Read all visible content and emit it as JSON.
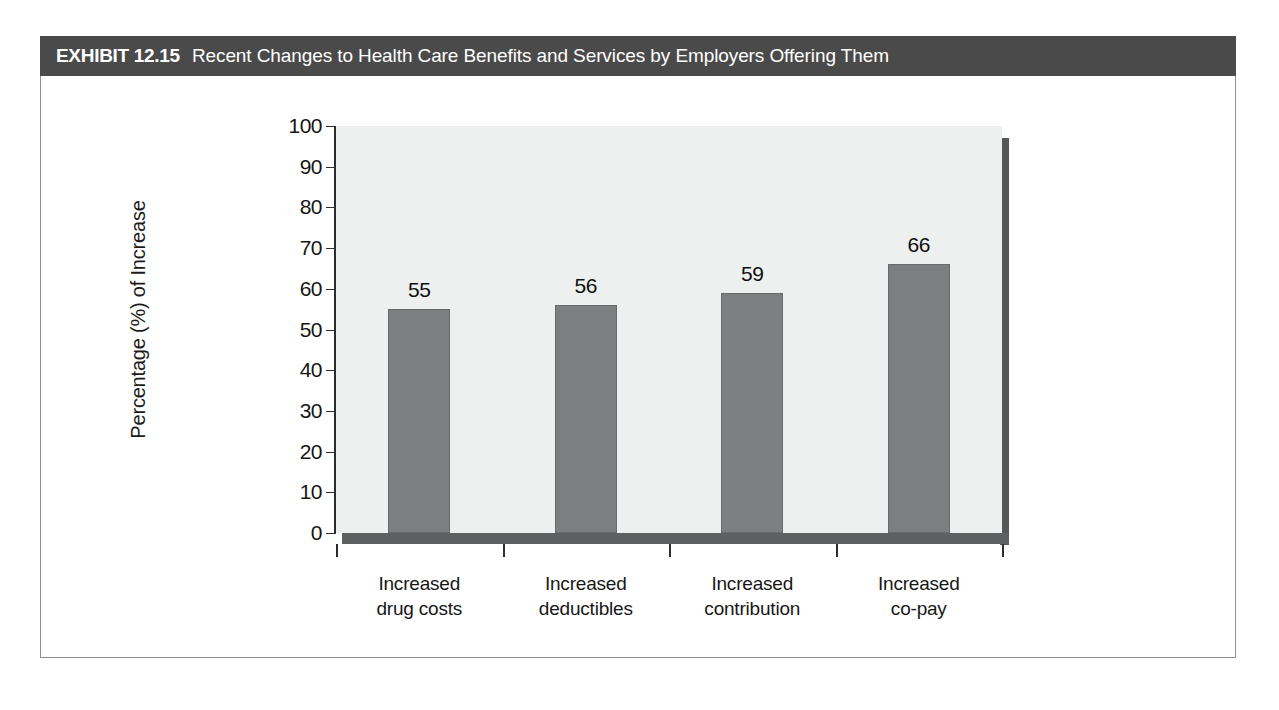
{
  "exhibit": {
    "number": "EXHIBIT 12.15",
    "title": "Recent Changes to Health Care Benefits and Services by Employers Offering Them"
  },
  "colors": {
    "title_bar_bg": "#4a4a4a",
    "title_text": "#ffffff",
    "bar_fill": "#7c7e80",
    "plot_bg": "#eef0f0",
    "axis": "#2d2d2d",
    "frame_border": "#8d8f92"
  },
  "chart_data": {
    "type": "bar",
    "title": "Recent Changes to Health Care Benefits and Services by Employers Offering Them",
    "categories": [
      "Increased drug costs",
      "Increased deductibles",
      "Increased contribution",
      "Increased co-pay"
    ],
    "category_lines": [
      [
        "Increased",
        "drug costs"
      ],
      [
        "Increased",
        "deductibles"
      ],
      [
        "Increased",
        "contribution"
      ],
      [
        "Increased",
        "co-pay"
      ]
    ],
    "values": [
      55,
      56,
      59,
      66
    ],
    "data_labels": [
      "55",
      "56",
      "59",
      "66"
    ],
    "xlabel": "",
    "ylabel": "Percentage (%) of Increase",
    "ylim": [
      0,
      100
    ],
    "ytick_step": 10,
    "ytick_labels": [
      "100",
      "90",
      "80",
      "70",
      "60",
      "50",
      "40",
      "30",
      "20",
      "10",
      "0"
    ],
    "grid": false,
    "legend": null
  }
}
